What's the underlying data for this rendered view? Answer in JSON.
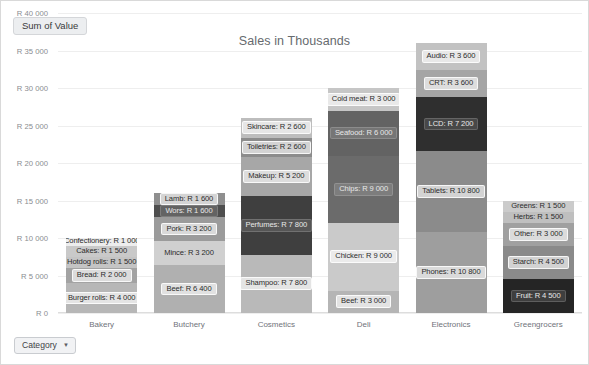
{
  "header": {
    "measure_badge": "Sum of Value"
  },
  "footer": {
    "filter_label": "Category",
    "caret_icon": "chevron-down-icon",
    "caret_glyph": "▼"
  },
  "chart_data": {
    "type": "bar",
    "stacked": true,
    "title": "Sales in Thousands",
    "xlabel": "",
    "ylabel": "",
    "ylim": [
      0,
      40000
    ],
    "ytick_values": [
      0,
      5000,
      10000,
      15000,
      20000,
      25000,
      30000,
      35000,
      40000
    ],
    "ytick_labels": [
      "R 0",
      "R 5 000",
      "R 10 000",
      "R 15 000",
      "R 20 000",
      "R 25 000",
      "R 30 000",
      "R 35 000",
      "R 40 000"
    ],
    "grid": true,
    "legend": "none",
    "currency_prefix": "R",
    "categories": [
      "Bakery",
      "Butchery",
      "Cosmetics",
      "Deli",
      "Electronics",
      "Greengrocers"
    ],
    "totals": [
      10000,
      16000,
      26000,
      30000,
      36000,
      15000
    ],
    "bars": [
      {
        "category": "Bakery",
        "total": 10000,
        "segments": [
          {
            "name": "Burger rolls",
            "value": 4000,
            "label": "Burger rolls: R 4 000",
            "color": "#b7b7b7",
            "text": "light"
          },
          {
            "name": "Bread",
            "value": 2000,
            "label": "Bread: R 2 000",
            "color": "#a3a3a3",
            "text": "light"
          },
          {
            "name": "Hotdog rolls",
            "value": 1500,
            "label": "Hotdog rolls: R 1 500",
            "color": "#c4c4c4",
            "text": "plain"
          },
          {
            "name": "Cakes",
            "value": 1500,
            "label": "Cakes: R 1 500",
            "color": "#c9c9c9",
            "text": "plain"
          },
          {
            "name": "Confectionery",
            "value": 1000,
            "label": "Confectionery: R 1 000",
            "color": "#cfcfcf",
            "text": "light"
          }
        ]
      },
      {
        "category": "Butchery",
        "total": 16000,
        "segments": [
          {
            "name": "Beef",
            "value": 6400,
            "label": "Beef: R 6 400",
            "color": "#b0b0b0",
            "text": "light"
          },
          {
            "name": "Mince",
            "value": 3200,
            "label": "Mince: R 3 200",
            "color": "#d0d0d0",
            "text": "plain"
          },
          {
            "name": "Pork",
            "value": 3200,
            "label": "Pork: R 3 200",
            "color": "#9b9b9b",
            "text": "light"
          },
          {
            "name": "Wors",
            "value": 1600,
            "label": "Wors: R 1 600",
            "color": "#4e4e4e",
            "text": "dark"
          },
          {
            "name": "Lamb",
            "value": 1600,
            "label": "Lamb: R 1 600",
            "color": "#8f8f8f",
            "text": "light"
          }
        ]
      },
      {
        "category": "Cosmetics",
        "total": 26000,
        "segments": [
          {
            "name": "Shampoo",
            "value": 7800,
            "label": "Shampoo: R 7 800",
            "color": "#b9b9b9",
            "text": "light"
          },
          {
            "name": "Perfumes",
            "value": 7800,
            "label": "Perfumes: R 7 800",
            "color": "#3f3f3f",
            "text": "dark"
          },
          {
            "name": "Makeup",
            "value": 5200,
            "label": "Makeup: R 5 200",
            "color": "#a7a7a7",
            "text": "light"
          },
          {
            "name": "Toiletries",
            "value": 2600,
            "label": "Toiletries: R 2 600",
            "color": "#8c8c8c",
            "text": "light"
          },
          {
            "name": "Skincare",
            "value": 2600,
            "label": "Skincare: R 2 600",
            "color": "#bdbdbd",
            "text": "light"
          }
        ]
      },
      {
        "category": "Deli",
        "total": 30000,
        "segments": [
          {
            "name": "Beef",
            "value": 3000,
            "label": "Beef: R 3 000",
            "color": "#b5b5b5",
            "text": "light"
          },
          {
            "name": "Chicken",
            "value": 9000,
            "label": "Chicken: R 9 000",
            "color": "#cacaca",
            "text": "light"
          },
          {
            "name": "Chips",
            "value": 9000,
            "label": "Chips: R 9 000",
            "color": "#6b6b6b",
            "text": "dark"
          },
          {
            "name": "Seafood",
            "value": 6000,
            "label": "Seafood: R 6 000",
            "color": "#636363",
            "text": "dark"
          },
          {
            "name": "Cold meat",
            "value": 3000,
            "label": "Cold meat: R 3 000",
            "color": "#c6c6c6",
            "text": "light"
          }
        ]
      },
      {
        "category": "Electronics",
        "total": 36000,
        "segments": [
          {
            "name": "Phones",
            "value": 10800,
            "label": "Phones: R 10 800",
            "color": "#9e9e9e",
            "text": "light"
          },
          {
            "name": "Tablets",
            "value": 10800,
            "label": "Tablets: R 10 800",
            "color": "#8b8b8b",
            "text": "light"
          },
          {
            "name": "LCD",
            "value": 7200,
            "label": "LCD: R 7 200",
            "color": "#2f2f2f",
            "text": "dark"
          },
          {
            "name": "CRT",
            "value": 3600,
            "label": "CRT: R 3 600",
            "color": "#a5a5a5",
            "text": "light"
          },
          {
            "name": "Audio",
            "value": 3600,
            "label": "Audio: R 3 600",
            "color": "#c2c2c2",
            "text": "light"
          }
        ]
      },
      {
        "category": "Greengrocers",
        "total": 15000,
        "segments": [
          {
            "name": "Fruit",
            "value": 4500,
            "label": "Fruit: R 4 500",
            "color": "#252525",
            "text": "dark"
          },
          {
            "name": "Starch",
            "value": 4500,
            "label": "Starch: R 4 500",
            "color": "#8a8a8a",
            "text": "light"
          },
          {
            "name": "Other",
            "value": 3000,
            "label": "Other: R 3 000",
            "color": "#a0a0a0",
            "text": "light"
          },
          {
            "name": "Herbs",
            "value": 1500,
            "label": "Herbs: R 1 500",
            "color": "#bfbfbf",
            "text": "plain"
          },
          {
            "name": "Greens",
            "value": 1500,
            "label": "Greens: R 1 500",
            "color": "#cbcbcb",
            "text": "plain"
          }
        ]
      }
    ]
  }
}
